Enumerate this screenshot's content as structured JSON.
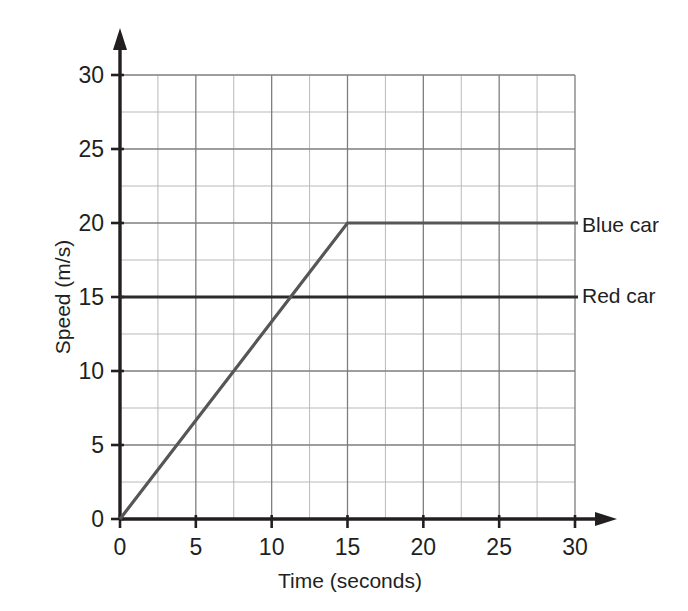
{
  "chart_data": {
    "type": "line",
    "title": "",
    "xlabel": "Time (seconds)",
    "ylabel": "Speed (m/s)",
    "xlim": [
      0,
      30
    ],
    "ylim": [
      0,
      30
    ],
    "xticks": [
      "0",
      "5",
      "10",
      "15",
      "20",
      "25",
      "30"
    ],
    "yticks": [
      "0",
      "5",
      "10",
      "15",
      "20",
      "25",
      "30"
    ],
    "xtick_values": [
      0,
      5,
      10,
      15,
      20,
      25,
      30
    ],
    "ytick_values": [
      0,
      5,
      10,
      15,
      20,
      25,
      30
    ],
    "grid": true,
    "grid_major_step": 5,
    "grid_minor_step": 2.5,
    "legend_position": "right-inline",
    "series": [
      {
        "name": "Blue car",
        "label": "Blue car",
        "color": "#565656",
        "x": [
          0,
          15,
          30
        ],
        "y": [
          0,
          20,
          20
        ],
        "description": "Accelerates uniformly from 0 m/s to 20 m/s in 15 s, then travels at constant 20 m/s"
      },
      {
        "name": "Red car",
        "label": "Red car",
        "color": "#2b2b2b",
        "x": [
          0,
          30
        ],
        "y": [
          15,
          15
        ],
        "description": "Constant speed of 15 m/s for the whole 30 s"
      }
    ]
  },
  "axes": {
    "x_title": "Time (seconds)",
    "y_title": "Speed (m/s)",
    "x_arrow": true,
    "y_arrow": true
  },
  "legend": {
    "blue_car": "Blue car",
    "red_car": "Red car"
  },
  "colors": {
    "axis": "#231f20",
    "grid_major": "#7b7b7b",
    "grid_minor": "#b4b4b4",
    "blue_car": "#565656",
    "red_car": "#2b2b2b",
    "background": "#ffffff"
  }
}
